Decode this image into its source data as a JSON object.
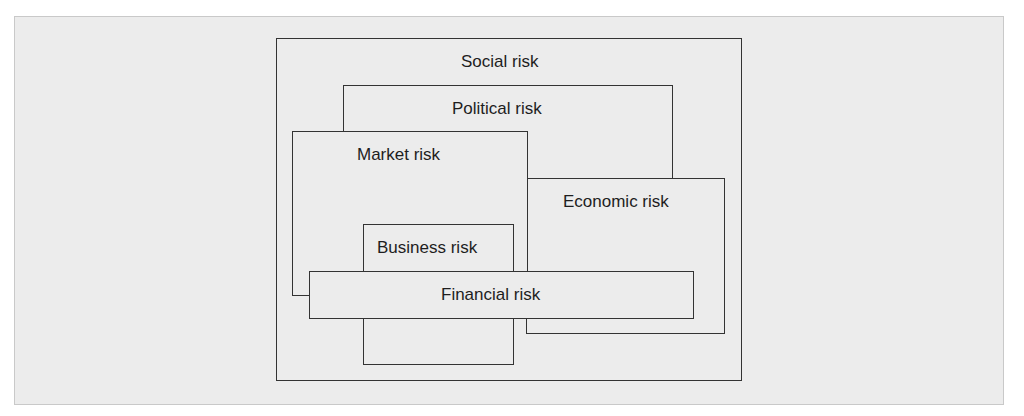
{
  "diagram": {
    "colors": {
      "background": "#ececec",
      "border": "#333333",
      "text": "#1e1e1e"
    },
    "boxes": [
      {
        "id": "social",
        "label": "Social risk"
      },
      {
        "id": "political",
        "label": "Political risk"
      },
      {
        "id": "market",
        "label": "Market risk"
      },
      {
        "id": "economic",
        "label": "Economic risk"
      },
      {
        "id": "business",
        "label": "Business risk"
      },
      {
        "id": "financial",
        "label": "Financial risk"
      }
    ]
  }
}
